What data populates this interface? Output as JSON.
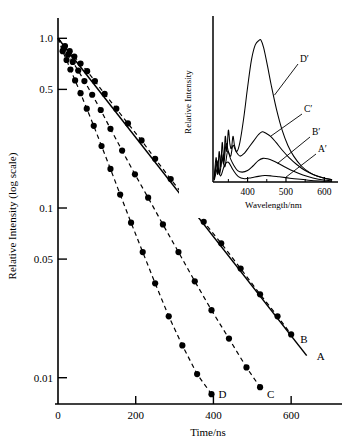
{
  "figure": {
    "title": "",
    "background_color": "#ffffff",
    "line_color": "#000000"
  },
  "chart_data": [
    {
      "id": "main-decay-plot",
      "type": "line",
      "title": "",
      "xlabel": "Time/ns",
      "ylabel": "Relative Intensity (log scale)",
      "xlim": [
        0,
        700
      ],
      "ylim": [
        0.007,
        1.15
      ],
      "yscale": "log",
      "grid": false,
      "legend_position": "inline-right-of-curve-ends",
      "xticks": [
        0,
        200,
        400,
        600
      ],
      "xticklabels": [
        "0",
        "200",
        "400",
        "600"
      ],
      "yticks": [
        1.0,
        0.5,
        0.1,
        0.05,
        0.01
      ],
      "yticklabels": [
        "1.0",
        "0.5",
        "0.1",
        "0.05",
        "0.01"
      ],
      "series": [
        {
          "name": "A",
          "label": "A",
          "style": "solid",
          "markers": false,
          "x": [
            0,
            640
          ],
          "y": [
            1.0,
            0.0135
          ]
        },
        {
          "name": "B",
          "label": "B",
          "style": "dashed",
          "markers": true,
          "x": [
            0,
            18,
            30,
            42,
            58,
            75,
            95,
            120,
            150,
            180,
            215,
            250,
            290,
            330,
            375,
            420,
            470,
            520,
            565,
            600
          ],
          "y": [
            1.0,
            0.9,
            0.84,
            0.78,
            0.71,
            0.64,
            0.56,
            0.47,
            0.385,
            0.315,
            0.25,
            0.195,
            0.148,
            0.113,
            0.083,
            0.062,
            0.044,
            0.031,
            0.023,
            0.018
          ]
        },
        {
          "name": "C",
          "label": "C",
          "style": "dashed",
          "markers": true,
          "x": [
            0,
            15,
            26,
            38,
            52,
            68,
            88,
            110,
            135,
            165,
            198,
            232,
            270,
            310,
            352,
            395,
            440,
            485,
            520
          ],
          "y": [
            1.0,
            0.875,
            0.8,
            0.725,
            0.645,
            0.56,
            0.465,
            0.378,
            0.293,
            0.218,
            0.158,
            0.115,
            0.08,
            0.055,
            0.037,
            0.025,
            0.017,
            0.0115,
            0.0088
          ]
        },
        {
          "name": "D",
          "label": "D",
          "style": "dashed",
          "markers": true,
          "x": [
            0,
            12,
            22,
            32,
            44,
            58,
            74,
            92,
            112,
            135,
            160,
            188,
            218,
            250,
            285,
            320,
            358,
            395
          ],
          "y": [
            1.0,
            0.84,
            0.745,
            0.655,
            0.565,
            0.475,
            0.385,
            0.305,
            0.232,
            0.17,
            0.12,
            0.082,
            0.055,
            0.036,
            0.023,
            0.0155,
            0.0105,
            0.008
          ]
        }
      ]
    },
    {
      "id": "inset-emission-spectra",
      "type": "line",
      "title": "",
      "xlabel": "Wavelength/nm",
      "ylabel": "Relative Intensity",
      "xlim": [
        310,
        625
      ],
      "ylim": [
        0,
        1.05
      ],
      "grid": false,
      "xticks": [
        400,
        500,
        600
      ],
      "xticklabels": [
        "400",
        "500",
        "600"
      ],
      "yticks": [],
      "yticklabels": [],
      "legend_position": "inline-annotations",
      "series": [
        {
          "name": "D-prime",
          "label": "D′",
          "style": "solid",
          "peak_wavelength_nm": 435,
          "peak_value": 0.93,
          "x": [
            313,
            318,
            322,
            326,
            330,
            334,
            338,
            342,
            346,
            350,
            354,
            358,
            362,
            366,
            372,
            380,
            390,
            400,
            410,
            420,
            430,
            435,
            442,
            452,
            462,
            475,
            490,
            505,
            520,
            540,
            560,
            580,
            600,
            620
          ],
          "y": [
            0.02,
            0.16,
            0.05,
            0.2,
            0.1,
            0.26,
            0.14,
            0.3,
            0.2,
            0.34,
            0.25,
            0.22,
            0.3,
            0.24,
            0.2,
            0.26,
            0.42,
            0.62,
            0.8,
            0.9,
            0.93,
            0.93,
            0.88,
            0.76,
            0.63,
            0.48,
            0.34,
            0.24,
            0.17,
            0.105,
            0.065,
            0.04,
            0.025,
            0.015
          ]
        },
        {
          "name": "C-prime",
          "label": "C′",
          "style": "solid",
          "peak_wavelength_nm": 438,
          "peak_value": 0.33,
          "x": [
            313,
            320,
            326,
            332,
            338,
            344,
            350,
            356,
            362,
            370,
            380,
            392,
            404,
            416,
            428,
            438,
            448,
            460,
            474,
            490,
            508,
            528,
            550,
            572,
            596,
            620
          ],
          "y": [
            0.02,
            0.14,
            0.06,
            0.18,
            0.12,
            0.25,
            0.2,
            0.17,
            0.24,
            0.2,
            0.17,
            0.19,
            0.23,
            0.27,
            0.31,
            0.33,
            0.32,
            0.3,
            0.26,
            0.21,
            0.16,
            0.115,
            0.075,
            0.048,
            0.028,
            0.015
          ]
        },
        {
          "name": "B-prime",
          "label": "B′",
          "style": "solid",
          "peak_wavelength_nm": 440,
          "peak_value": 0.155,
          "x": [
            313,
            320,
            327,
            334,
            341,
            348,
            356,
            364,
            374,
            386,
            400,
            414,
            428,
            440,
            452,
            466,
            482,
            500,
            520,
            544,
            570,
            598,
            620
          ],
          "y": [
            0.015,
            0.12,
            0.05,
            0.15,
            0.1,
            0.2,
            0.15,
            0.11,
            0.075,
            0.065,
            0.075,
            0.105,
            0.14,
            0.155,
            0.152,
            0.14,
            0.12,
            0.095,
            0.07,
            0.046,
            0.027,
            0.013,
            0.008
          ]
        },
        {
          "name": "A-prime",
          "label": "A′",
          "style": "solid",
          "peak_wavelength_nm": 445,
          "peak_value": 0.042,
          "x": [
            313,
            322,
            330,
            340,
            350,
            362,
            376,
            392,
            410,
            428,
            445,
            462,
            482,
            504,
            530,
            558,
            588,
            620
          ],
          "y": [
            0.01,
            0.09,
            0.04,
            0.11,
            0.13,
            0.08,
            0.035,
            0.022,
            0.028,
            0.037,
            0.042,
            0.04,
            0.034,
            0.027,
            0.019,
            0.012,
            0.007,
            0.004
          ]
        }
      ]
    }
  ]
}
